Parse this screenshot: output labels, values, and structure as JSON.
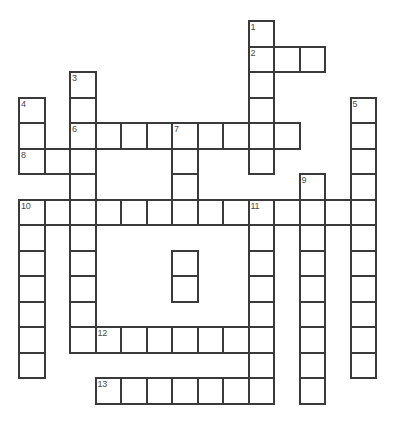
{
  "puzzle": {
    "kind": "crossword-grid",
    "title": "Crossword Puzzle Grid",
    "background_color": "#ffffff",
    "cell_fill_color": "#ffffff",
    "cell_border_color": "#3a3a3a",
    "number_color": "#4a4a4a",
    "cell_size_px": 25.5,
    "origin_x_px": 18,
    "origin_y_px": 20,
    "columns": 16,
    "rows": 16,
    "clue_count": 13
  },
  "entries": [
    {
      "number": "1",
      "direction": "down",
      "row": 0,
      "col": 9,
      "length": 7
    },
    {
      "number": "2",
      "direction": "across",
      "row": 1,
      "col": 9,
      "length": 3
    },
    {
      "number": "3",
      "direction": "down",
      "row": 2,
      "col": 2,
      "length": 11
    },
    {
      "number": "4",
      "direction": "down",
      "row": 3,
      "col": 0,
      "length": 3
    },
    {
      "number": "5",
      "direction": "down",
      "row": 3,
      "col": 13,
      "length": 11
    },
    {
      "number": "6",
      "direction": "across",
      "row": 4,
      "col": 2,
      "length": 9
    },
    {
      "number": "7",
      "direction": "down",
      "row": 4,
      "col": 6,
      "length": 7
    },
    {
      "number": "8",
      "direction": "across",
      "row": 5,
      "col": 0,
      "length": 3
    },
    {
      "number": "9",
      "direction": "down",
      "row": 6,
      "col": 11,
      "length": 9
    },
    {
      "number": "10",
      "direction": "across",
      "row": 7,
      "col": 0,
      "length": 14
    },
    {
      "number": "10",
      "direction": "down",
      "row": 7,
      "col": 0,
      "length": 7
    },
    {
      "number": "11",
      "direction": "down",
      "row": 7,
      "col": 9,
      "length": 8
    },
    {
      "number": "12",
      "direction": "across",
      "row": 12,
      "col": 3,
      "length": 7
    },
    {
      "number": "13",
      "direction": "across",
      "row": 14,
      "col": 3,
      "length": 7
    }
  ],
  "cells": [
    {
      "row": 0,
      "col": 9,
      "number": "1"
    },
    {
      "row": 1,
      "col": 9,
      "number": "2"
    },
    {
      "row": 1,
      "col": 10,
      "number": ""
    },
    {
      "row": 1,
      "col": 11,
      "number": ""
    },
    {
      "row": 2,
      "col": 2,
      "number": "3"
    },
    {
      "row": 2,
      "col": 9,
      "number": ""
    },
    {
      "row": 3,
      "col": 0,
      "number": "4"
    },
    {
      "row": 3,
      "col": 2,
      "number": ""
    },
    {
      "row": 3,
      "col": 9,
      "number": ""
    },
    {
      "row": 3,
      "col": 13,
      "number": "5"
    },
    {
      "row": 4,
      "col": 0,
      "number": ""
    },
    {
      "row": 4,
      "col": 2,
      "number": "6"
    },
    {
      "row": 4,
      "col": 3,
      "number": ""
    },
    {
      "row": 4,
      "col": 4,
      "number": ""
    },
    {
      "row": 4,
      "col": 5,
      "number": ""
    },
    {
      "row": 4,
      "col": 6,
      "number": "7"
    },
    {
      "row": 4,
      "col": 7,
      "number": ""
    },
    {
      "row": 4,
      "col": 8,
      "number": ""
    },
    {
      "row": 4,
      "col": 9,
      "number": ""
    },
    {
      "row": 4,
      "col": 10,
      "number": ""
    },
    {
      "row": 4,
      "col": 13,
      "number": ""
    },
    {
      "row": 5,
      "col": 0,
      "number": "8"
    },
    {
      "row": 5,
      "col": 1,
      "number": ""
    },
    {
      "row": 5,
      "col": 2,
      "number": ""
    },
    {
      "row": 5,
      "col": 6,
      "number": ""
    },
    {
      "row": 5,
      "col": 9,
      "number": ""
    },
    {
      "row": 5,
      "col": 13,
      "number": ""
    },
    {
      "row": 6,
      "col": 2,
      "number": ""
    },
    {
      "row": 6,
      "col": 6,
      "number": ""
    },
    {
      "row": 6,
      "col": 11,
      "number": "9"
    },
    {
      "row": 6,
      "col": 13,
      "number": ""
    },
    {
      "row": 7,
      "col": 0,
      "number": "10"
    },
    {
      "row": 7,
      "col": 1,
      "number": ""
    },
    {
      "row": 7,
      "col": 2,
      "number": ""
    },
    {
      "row": 7,
      "col": 3,
      "number": ""
    },
    {
      "row": 7,
      "col": 4,
      "number": ""
    },
    {
      "row": 7,
      "col": 5,
      "number": ""
    },
    {
      "row": 7,
      "col": 6,
      "number": ""
    },
    {
      "row": 7,
      "col": 7,
      "number": ""
    },
    {
      "row": 7,
      "col": 8,
      "number": ""
    },
    {
      "row": 7,
      "col": 9,
      "number": "11"
    },
    {
      "row": 7,
      "col": 10,
      "number": ""
    },
    {
      "row": 7,
      "col": 11,
      "number": ""
    },
    {
      "row": 7,
      "col": 12,
      "number": ""
    },
    {
      "row": 7,
      "col": 13,
      "number": ""
    },
    {
      "row": 8,
      "col": 0,
      "number": ""
    },
    {
      "row": 8,
      "col": 2,
      "number": ""
    },
    {
      "row": 8,
      "col": 9,
      "number": ""
    },
    {
      "row": 8,
      "col": 11,
      "number": ""
    },
    {
      "row": 8,
      "col": 13,
      "number": ""
    },
    {
      "row": 9,
      "col": 0,
      "number": ""
    },
    {
      "row": 9,
      "col": 2,
      "number": ""
    },
    {
      "row": 9,
      "col": 6,
      "number": ""
    },
    {
      "row": 9,
      "col": 9,
      "number": ""
    },
    {
      "row": 9,
      "col": 11,
      "number": ""
    },
    {
      "row": 9,
      "col": 13,
      "number": ""
    },
    {
      "row": 10,
      "col": 0,
      "number": ""
    },
    {
      "row": 10,
      "col": 2,
      "number": ""
    },
    {
      "row": 10,
      "col": 6,
      "number": ""
    },
    {
      "row": 10,
      "col": 9,
      "number": ""
    },
    {
      "row": 10,
      "col": 11,
      "number": ""
    },
    {
      "row": 10,
      "col": 13,
      "number": ""
    },
    {
      "row": 11,
      "col": 0,
      "number": ""
    },
    {
      "row": 11,
      "col": 2,
      "number": ""
    },
    {
      "row": 11,
      "col": 9,
      "number": ""
    },
    {
      "row": 11,
      "col": 11,
      "number": ""
    },
    {
      "row": 11,
      "col": 13,
      "number": ""
    },
    {
      "row": 12,
      "col": 0,
      "number": ""
    },
    {
      "row": 12,
      "col": 2,
      "number": ""
    },
    {
      "row": 12,
      "col": 3,
      "number": "12"
    },
    {
      "row": 12,
      "col": 4,
      "number": ""
    },
    {
      "row": 12,
      "col": 5,
      "number": ""
    },
    {
      "row": 12,
      "col": 6,
      "number": ""
    },
    {
      "row": 12,
      "col": 7,
      "number": ""
    },
    {
      "row": 12,
      "col": 8,
      "number": ""
    },
    {
      "row": 12,
      "col": 9,
      "number": ""
    },
    {
      "row": 12,
      "col": 11,
      "number": ""
    },
    {
      "row": 12,
      "col": 13,
      "number": ""
    },
    {
      "row": 13,
      "col": 0,
      "number": ""
    },
    {
      "row": 13,
      "col": 9,
      "number": ""
    },
    {
      "row": 13,
      "col": 11,
      "number": ""
    },
    {
      "row": 13,
      "col": 13,
      "number": ""
    },
    {
      "row": 14,
      "col": 3,
      "number": "13"
    },
    {
      "row": 14,
      "col": 4,
      "number": ""
    },
    {
      "row": 14,
      "col": 5,
      "number": ""
    },
    {
      "row": 14,
      "col": 6,
      "number": ""
    },
    {
      "row": 14,
      "col": 7,
      "number": ""
    },
    {
      "row": 14,
      "col": 8,
      "number": ""
    },
    {
      "row": 14,
      "col": 9,
      "number": ""
    },
    {
      "row": 14,
      "col": 11,
      "number": ""
    }
  ]
}
